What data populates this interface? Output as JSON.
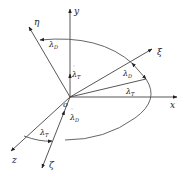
{
  "diagram": {
    "type": "coordinate-frame-rotation",
    "origin_label": "o",
    "axes": [
      {
        "name": "x",
        "label": "x"
      },
      {
        "name": "y",
        "label": "y"
      },
      {
        "name": "z",
        "label": "z"
      },
      {
        "name": "xi",
        "label": "ξ"
      },
      {
        "name": "eta",
        "label": "η"
      },
      {
        "name": "zeta",
        "label": "ζ"
      }
    ],
    "angle_labels": {
      "lambda_D_top": "λD",
      "lambda_T_y": "λT",
      "lambda_D_xi": "λD",
      "lambda_T_x": "λT",
      "lambda_T_z": "λT",
      "lambda_D_zeta": "λD"
    },
    "angle_label_parts": {
      "lambda": "λ",
      "D": "D",
      "T": "T"
    },
    "colors": {
      "line": "#444444",
      "text": "#222222",
      "background": "#ffffff"
    }
  }
}
